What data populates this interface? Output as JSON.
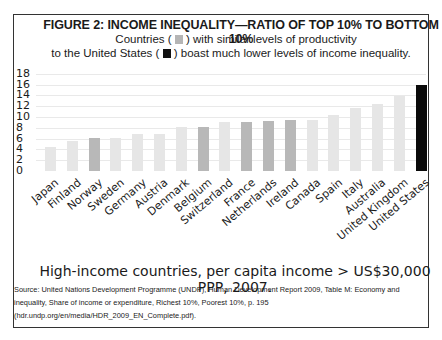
{
  "figure": {
    "title": "FIGURE 2: INCOME INEQUALITY—RATIO OF TOP 10% TO BOTTOM 10%",
    "subtitle_line1_a": "Countries (",
    "subtitle_line1_b": ") with similar levels of productivity",
    "subtitle_line2_a": "to the United States (",
    "subtitle_line2_b": ") boast much lower levels of income inequality.",
    "caption": "High-income countries, per capita income > US$30,000 PPP, 2007.",
    "source": "Source:  United Nations Development Programme (UNDP), Human Development Report 2009, Table M: Economy and inequality, Share of income or expenditure, Richest 10%, Poorest 10%, p. 195 (hdr.undp.org/en/media/HDR_2009_EN_Complete.pdf)."
  },
  "colors": {
    "light": "#e6e6e6",
    "medium": "#b8b8b8",
    "us": "#0a0a0a",
    "legend_gray": "#b5b5b5",
    "legend_black": "#111111"
  },
  "chart_data": {
    "type": "bar",
    "title": "FIGURE 2: INCOME INEQUALITY—RATIO OF TOP 10% TO BOTTOM 10%",
    "subtitle": "Countries ( ) with similar levels of productivity to the United States ( ) boast much lower levels of income inequality.",
    "xlabel": "High-income countries, per capita income > US$30,000 PPP, 2007.",
    "ylabel": "",
    "ylim": [
      0,
      18
    ],
    "yticks": [
      0,
      2,
      4,
      6,
      8,
      10,
      12,
      14,
      16,
      18
    ],
    "grid": true,
    "legend": [
      "Countries with similar productivity (gray)",
      "United States (black)"
    ],
    "categories": [
      "Japan",
      "Finland",
      "Norway",
      "Sweden",
      "Germany",
      "Austria",
      "Denmark",
      "Belgium",
      "Switzerland",
      "France",
      "Netherlands",
      "Ireland",
      "Canada",
      "Spain",
      "Italy",
      "Australia",
      "United Kingdom",
      "United States"
    ],
    "values": [
      4.5,
      5.6,
      6.1,
      6.2,
      6.9,
      6.9,
      8.1,
      8.2,
      9.0,
      9.1,
      9.2,
      9.4,
      9.4,
      10.3,
      11.6,
      12.5,
      13.8,
      15.9
    ],
    "bar_shade": [
      "light",
      "light",
      "medium",
      "light",
      "light",
      "light",
      "light",
      "medium",
      "light",
      "medium",
      "medium",
      "medium",
      "light",
      "light",
      "light",
      "light",
      "light",
      "us"
    ]
  }
}
